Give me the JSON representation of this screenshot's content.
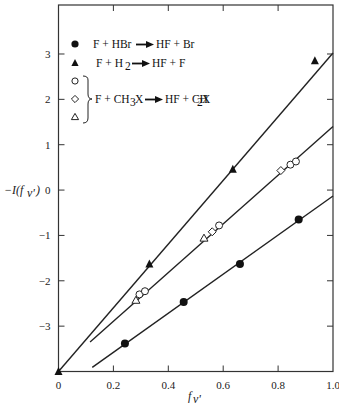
{
  "chart_data": {
    "type": "scatter",
    "title": "",
    "xlabel": "f_v'",
    "ylabel": "−I(f_v')",
    "xlim": [
      0,
      1.0
    ],
    "ylim": [
      -4.0,
      4.08
    ],
    "grid": false,
    "legend_position": "upper-left inside",
    "x_ticks": [
      0,
      0.2,
      0.4,
      0.6,
      0.8,
      1.0
    ],
    "x_tick_labels": [
      "0",
      "0.2",
      "0.4",
      "0.6",
      "0.8",
      "1.0"
    ],
    "y_ticks": [
      -3,
      -2,
      -1,
      0,
      1,
      2,
      3
    ],
    "y_tick_labels": [
      "−3",
      "−2",
      "−1",
      "0",
      "1",
      "2",
      "3"
    ],
    "series": [
      {
        "name": "F + HBr → HF + Br",
        "marker": "filled-circle",
        "x": [
          0.242,
          0.456,
          0.661,
          0.875
        ],
        "y": [
          -3.38,
          -2.47,
          -1.63,
          -0.65
        ],
        "fit_line": {
          "x": [
            0.123,
            1.0
          ],
          "y": [
            -3.91,
            -0.13
          ]
        }
      },
      {
        "name": "F + H2 → HF + F",
        "marker": "filled-triangle",
        "x": [
          0.0,
          0.331,
          0.635,
          0.934
        ],
        "y": [
          -4.0,
          -1.63,
          0.46,
          2.85
        ],
        "fit_line": {
          "x": [
            0.0,
            1.0
          ],
          "y": [
            -4.0,
            3.02
          ]
        }
      },
      {
        "name": "F + CH3X → HF + CH2X (open circle)",
        "marker": "open-circle",
        "x": [
          0.295,
          0.315,
          0.585,
          0.845,
          0.865
        ],
        "y": [
          -2.3,
          -2.23,
          -0.78,
          0.56,
          0.63
        ],
        "fit_line": {
          "x": [
            0.115,
            1.0
          ],
          "y": [
            -3.35,
            1.4
          ]
        }
      },
      {
        "name": "F + CH3X → HF + CH2X (open diamond)",
        "marker": "open-diamond",
        "x": [
          0.56,
          0.81
        ],
        "y": [
          -0.92,
          0.43
        ]
      },
      {
        "name": "F + CH3X → HF + CH2X (open triangle)",
        "marker": "open-triangle",
        "x": [
          0.282,
          0.53
        ],
        "y": [
          -2.43,
          -1.06
        ]
      }
    ],
    "annotations": []
  },
  "legend": {
    "items": [
      {
        "marker": "filled-circle",
        "text_parts": [
          "F + HBr",
          "HF + Br"
        ]
      },
      {
        "marker": "filled-triangle",
        "text_parts": [
          "F + H",
          "HF + F"
        ]
      },
      {
        "marker": "open-circle"
      },
      {
        "marker": "open-diamond"
      },
      {
        "marker": "open-triangle"
      }
    ],
    "bracket_label": {
      "left": "F + CH",
      "right": "HF + CH",
      "x_suffix": "X"
    }
  },
  "axes": {
    "xlabel_main": "f",
    "xlabel_sub": "v'",
    "ylabel_text": "−I(f",
    "ylabel_sub": "v'",
    "ylabel_close": ")"
  }
}
